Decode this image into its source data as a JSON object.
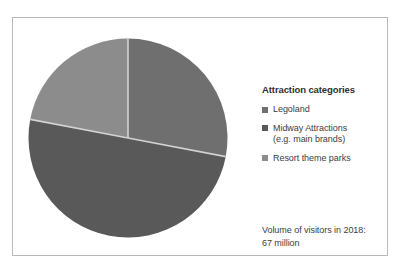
{
  "chart_data": {
    "type": "pie",
    "title": "",
    "legend_title": "Attraction categories",
    "legend_position": "right",
    "categories": [
      "Legoland",
      "Midway Attractions (e.g. main brands)",
      "Resort theme parks"
    ],
    "values": [
      28,
      50,
      22
    ],
    "unit": "percent",
    "colors": [
      "#6f6f6f",
      "#595959",
      "#8c8c8c"
    ],
    "slices": [
      {
        "label": "Legoland",
        "value": 28,
        "color": "#6f6f6f",
        "start_angle": 0,
        "end_angle": 100.8
      },
      {
        "label": "Midway Attractions (e.g. main brands)",
        "value": 50,
        "color": "#595959",
        "start_angle": 100.8,
        "end_angle": 280.8
      },
      {
        "label": "Resort theme parks",
        "value": 22,
        "color": "#8c8c8c",
        "start_angle": 280.8,
        "end_angle": 360
      }
    ],
    "annotations": [
      "Volume of visitors in 2018:",
      "67 million"
    ],
    "xlabel": "",
    "ylabel": ""
  },
  "legend": {
    "title": "Attraction categories",
    "items": [
      {
        "label": "Legoland",
        "sub_label": "",
        "color": "#6f6f6f"
      },
      {
        "label": "Midway Attractions",
        "sub_label": "(e.g. main brands)",
        "color": "#595959"
      },
      {
        "label": "Resort theme parks",
        "sub_label": "",
        "color": "#8c8c8c"
      }
    ]
  },
  "caption": {
    "line1": "Volume of visitors in 2018:",
    "line2": "67 million"
  },
  "style": {
    "frame_border": "#b9b9b9",
    "background": "#ffffff",
    "slice_divider": "#d2d2d2",
    "text": "#3d3d3d"
  }
}
